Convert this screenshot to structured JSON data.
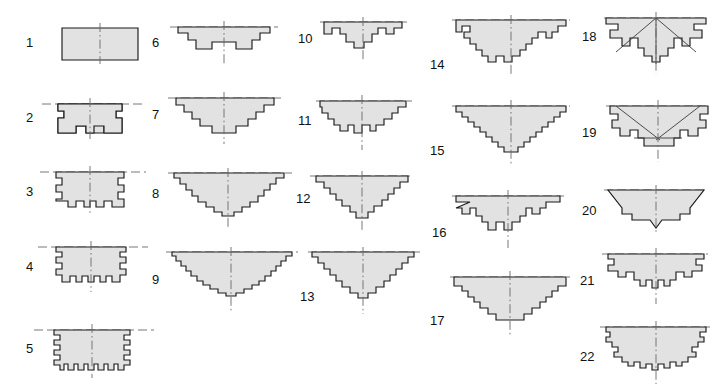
{
  "figure": {
    "background_color": "#ffffff",
    "shape_fill_color": "#e2e2e2",
    "shape_outline_color": "#1a1a1a",
    "axis_color": "#6a6a6a",
    "item_count": 22,
    "columns": 5,
    "items": [
      {
        "label": "1",
        "column": 1,
        "row": 1
      },
      {
        "label": "2",
        "column": 1,
        "row": 2
      },
      {
        "label": "3",
        "column": 1,
        "row": 3
      },
      {
        "label": "4",
        "column": 1,
        "row": 4
      },
      {
        "label": "5",
        "column": 1,
        "row": 5
      },
      {
        "label": "6",
        "column": 2,
        "row": 1
      },
      {
        "label": "7",
        "column": 2,
        "row": 2
      },
      {
        "label": "8",
        "column": 2,
        "row": 3
      },
      {
        "label": "9",
        "column": 2,
        "row": 4
      },
      {
        "label": "10",
        "column": 3,
        "row": 1
      },
      {
        "label": "11",
        "column": 3,
        "row": 2
      },
      {
        "label": "12",
        "column": 3,
        "row": 3
      },
      {
        "label": "13",
        "column": 3,
        "row": 4
      },
      {
        "label": "14",
        "column": 4,
        "row": 1
      },
      {
        "label": "15",
        "column": 4,
        "row": 2
      },
      {
        "label": "16",
        "column": 4,
        "row": 3
      },
      {
        "label": "17",
        "column": 4,
        "row": 4
      },
      {
        "label": "18",
        "column": 5,
        "row": 1
      },
      {
        "label": "19",
        "column": 5,
        "row": 2
      },
      {
        "label": "20",
        "column": 5,
        "row": 3
      },
      {
        "label": "21",
        "column": 5,
        "row": 4
      },
      {
        "label": "22",
        "column": 5,
        "row": 5
      }
    ]
  }
}
